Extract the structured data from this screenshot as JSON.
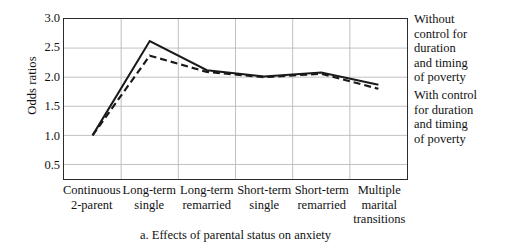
{
  "chart_data": {
    "type": "line",
    "title": "",
    "caption": "a. Effects of parental status on anxiety",
    "xlabel": "",
    "ylabel": "Odds ratios",
    "ylim": [
      0.25,
      3.0
    ],
    "yticks": [
      "3.0",
      "2.5",
      "2.0",
      "1.5",
      "1.0",
      "0.5"
    ],
    "ytick_values": [
      3.0,
      2.5,
      2.0,
      1.5,
      1.0,
      0.5
    ],
    "grid": "both",
    "legend_position": "right",
    "categories": [
      "Continuous 2-parent",
      "Long-term single",
      "Long-term remarried",
      "Short-term single",
      "Short-term remarried",
      "Multiple marital transitions"
    ],
    "category_lines": [
      [
        "Continuous",
        "2-parent"
      ],
      [
        "Long-term",
        "single"
      ],
      [
        "Long-term",
        "remarried"
      ],
      [
        "Short-term",
        "single"
      ],
      [
        "Short-term",
        "remarried"
      ],
      [
        "Multiple",
        "marital",
        "transitions"
      ]
    ],
    "series": [
      {
        "name": "Without control for duration and timing of poverty",
        "style": "solid",
        "color": "#1a1a1a",
        "values": [
          1.0,
          2.62,
          2.12,
          2.01,
          2.08,
          1.87
        ]
      },
      {
        "name": "With control for duration and timing of poverty",
        "style": "dashed",
        "color": "#1a1a1a",
        "values": [
          1.0,
          2.37,
          2.09,
          2.0,
          2.06,
          1.8
        ]
      }
    ]
  },
  "legend": {
    "without": [
      "Without",
      "control for",
      "duration",
      "and timing",
      "of poverty"
    ],
    "with": [
      "With control",
      "for duration",
      "and timing",
      "of poverty"
    ]
  }
}
